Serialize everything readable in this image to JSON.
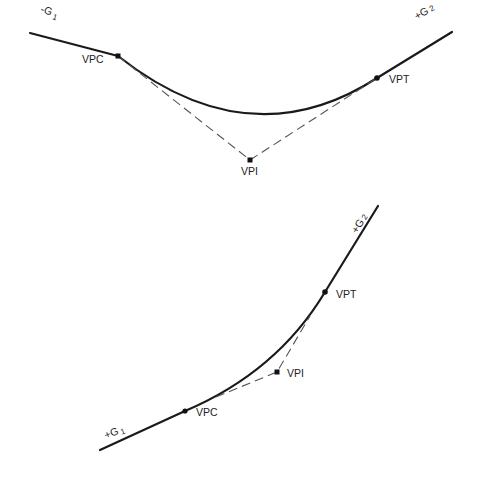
{
  "diagrams": [
    {
      "name": "sag-vertical-curve",
      "grade_in": {
        "sign": "-",
        "label": "G",
        "sub": "1"
      },
      "grade_out": {
        "sign": "+",
        "label": "G",
        "sub": "2"
      },
      "points": {
        "vpc": "VPC",
        "vpi": "VPI",
        "vpt": "VPT"
      }
    },
    {
      "name": "crest-less-unsymmetrical-vertical-curve",
      "grade_in": {
        "sign": "+",
        "label": "G",
        "sub": "1"
      },
      "grade_out": {
        "sign": "+",
        "label": "G",
        "sub": "2"
      },
      "points": {
        "vpc": "VPC",
        "vpi": "VPI",
        "vpt": "VPT"
      }
    }
  ],
  "colors": {
    "line": "#1a1a1a",
    "tangent": "#555555",
    "background": "#ffffff"
  }
}
